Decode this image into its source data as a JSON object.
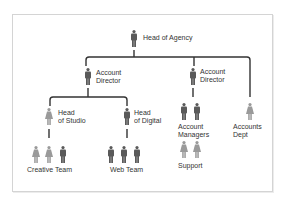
{
  "chart": {
    "colors": {
      "male": "#5a5a5a",
      "female": "#9a9a9a",
      "line": "#333333",
      "frame": "#d4d4d4"
    },
    "nodes": {
      "head_of_agency": {
        "label": "Head of Agency",
        "icon": "male-person-icon"
      },
      "account_director_1": {
        "label": "Account\nDirector",
        "icon": "male-person-icon"
      },
      "account_director_2": {
        "label": "Account\nDirector",
        "icon": "male-person-icon"
      },
      "head_of_studio": {
        "label": "Head\nof Studio",
        "icon": "female-person-icon"
      },
      "head_of_digital": {
        "label": "Head\nof Digital",
        "icon": "male-person-icon"
      },
      "creative_team": {
        "label": "Creative Team",
        "icons": [
          "female-person-icon",
          "female-person-icon",
          "male-person-icon"
        ]
      },
      "web_team": {
        "label": "Web Team",
        "icons": [
          "male-person-icon",
          "male-person-icon",
          "male-person-icon"
        ]
      },
      "account_managers": {
        "label": "Account\nManagers",
        "icons": [
          "male-person-icon",
          "male-person-icon"
        ]
      },
      "support": {
        "label": "Support",
        "icons": [
          "female-person-icon",
          "female-person-icon"
        ]
      },
      "accounts_dept": {
        "label": "Accounts\nDept",
        "icon": "female-person-icon"
      }
    }
  }
}
